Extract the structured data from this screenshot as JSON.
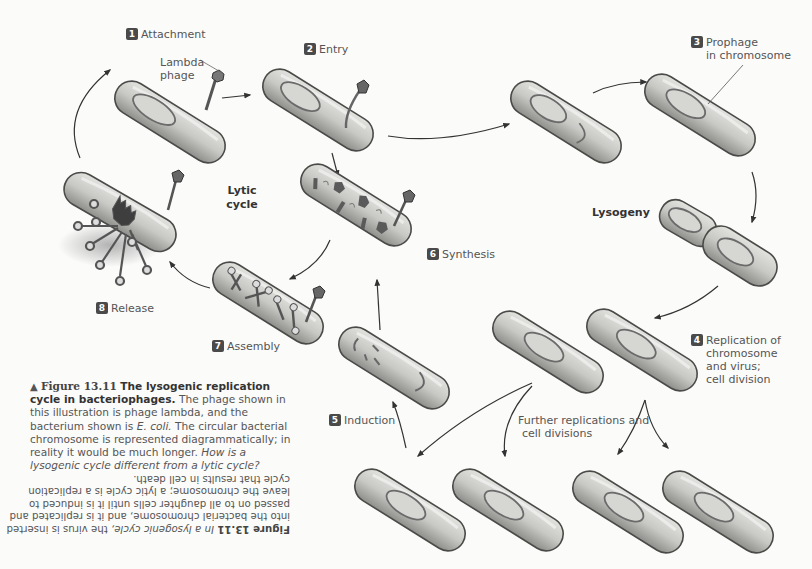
{
  "figure": {
    "number": "Figure 13.11",
    "title": "The lysogenic replication cycle in bacteriophages.",
    "caption_body": "The phage shown in this illustration is phage lambda, and the bacterium shown is",
    "organism": "E. coli.",
    "caption_rest": "The circular bacterial chromosome is represented diagrammatically; in reality it would be much longer.",
    "question": "How is a lysogenic cycle different from a lytic cycle?",
    "arrow_glyph": "▲"
  },
  "answer": {
    "label": "Figure 13.11",
    "intro": "In a lysogenic cycle,",
    "text": "the virus is inserted into the bacterial chromosome, and it is replicated and passed on to all daughter cells until it is induced to leave the chromosome; a lytic cycle is a replication cycle that results in cell death.",
    "orientation": "upside-down"
  },
  "steps": [
    {
      "number": "1",
      "label": "Attachment"
    },
    {
      "number": "2",
      "label": "Entry"
    },
    {
      "number": "3",
      "label": "Prophage",
      "label2": "in chromosome"
    },
    {
      "number": "4",
      "label": "Replication of",
      "label2": "chromosome",
      "label3": "and virus;",
      "label4": "cell division"
    },
    {
      "number": "5",
      "label": "Induction"
    },
    {
      "number": "6",
      "label": "Synthesis"
    },
    {
      "number": "7",
      "label": "Assembly"
    },
    {
      "number": "8",
      "label": "Release"
    }
  ],
  "annotations": {
    "lambda_phage": {
      "line1": "Lambda",
      "line2": "phage"
    },
    "lytic_cycle": {
      "line1": "Lytic",
      "line2": "cycle"
    },
    "lysogeny": "Lysogeny",
    "further": {
      "line1": "Further replications and",
      "line2": "cell divisions"
    }
  },
  "colors": {
    "background": "#fbfbfa",
    "cell_fill": "#c9c9c6",
    "cell_stroke": "#4a4a48",
    "chromosome": "#6b6b6b",
    "badge": "#4a4a4a",
    "text": "#555555"
  }
}
